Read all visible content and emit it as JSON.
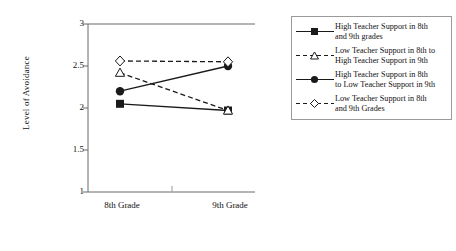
{
  "chart_data": {
    "type": "line",
    "title": "",
    "xlabel": "",
    "ylabel": "Level of Avoidance",
    "categories": [
      "8th Grade",
      "9th Grade"
    ],
    "ylim": [
      1,
      3
    ],
    "yticks": [
      "1",
      "1.5",
      "2",
      "2.5",
      "3"
    ],
    "ytick_values": [
      1,
      1.5,
      2,
      2.5,
      3
    ],
    "grid": false,
    "legend_position": "right",
    "series": [
      {
        "name": "High Teacher Support in 8th and 9th grades",
        "values": [
          2.05,
          1.97
        ],
        "marker": "filled-square",
        "line": "solid",
        "color": "#1a1a1a"
      },
      {
        "name": "Low Teacher Support in 8th to High Teacher Support in 9th",
        "values": [
          2.42,
          1.97
        ],
        "marker": "open-triangle",
        "line": "dashed",
        "color": "#1a1a1a"
      },
      {
        "name": "High Teacher Support in 8th to Low Teacher Support in 9th",
        "values": [
          2.2,
          2.5
        ],
        "marker": "filled-circle",
        "line": "solid",
        "color": "#1a1a1a"
      },
      {
        "name": "Low Teacher Support in 8th and 9th Grades",
        "values": [
          2.56,
          2.55
        ],
        "marker": "open-diamond",
        "line": "dashed",
        "color": "#1a1a1a"
      }
    ]
  },
  "axes": {
    "y_title": "Level of Avoidance",
    "y_tick_labels": [
      "3",
      "2.5",
      "2",
      "1.5",
      "1"
    ],
    "x_tick_labels": [
      "8th Grade",
      "9th Grade"
    ]
  },
  "legend": {
    "items": [
      {
        "label": "High Teacher Support in 8th\nand 9th grades",
        "marker": "filled-square",
        "line": "solid"
      },
      {
        "label": "Low Teacher Support in 8th to\nHigh Teacher Support in 9th",
        "marker": "open-triangle",
        "line": "dashed"
      },
      {
        "label": "High Teacher Support in 8th\nto Low Teacher Support in 9th",
        "marker": "filled-circle",
        "line": "solid"
      },
      {
        "label": "Low Teacher Support in 8th\nand 9th Grades",
        "marker": "open-diamond",
        "line": "dashed"
      }
    ]
  },
  "style": {
    "axis_color": "#6b6b6b",
    "series_color": "#1a1a1a",
    "legend_border": "#9a9a9a",
    "background": "#ffffff"
  }
}
